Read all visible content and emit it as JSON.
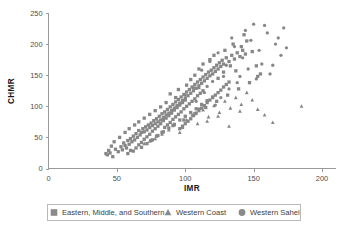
{
  "chart_data": {
    "type": "scatter",
    "title": "",
    "xlabel": "IMR",
    "ylabel": "CHMR",
    "xlim": [
      0,
      200
    ],
    "ylim": [
      0,
      250
    ],
    "xticks": [
      0,
      50,
      100,
      150,
      200
    ],
    "yticks": [
      0,
      50,
      100,
      150,
      200,
      250
    ],
    "grid": false,
    "legend_position": "bottom-center",
    "marker_color": "#878787",
    "axis_color": "#9a9a9a",
    "series": [
      {
        "name": "Eastern, Middle, and Southern",
        "marker": "square",
        "points": [
          [
            43,
            22
          ],
          [
            45,
            25
          ],
          [
            47,
            19
          ],
          [
            49,
            31
          ],
          [
            51,
            27
          ],
          [
            53,
            35
          ],
          [
            54,
            30
          ],
          [
            55,
            41
          ],
          [
            56,
            37
          ],
          [
            57,
            33
          ],
          [
            58,
            45
          ],
          [
            59,
            39
          ],
          [
            60,
            48
          ],
          [
            61,
            43
          ],
          [
            62,
            52
          ],
          [
            63,
            46
          ],
          [
            64,
            56
          ],
          [
            65,
            50
          ],
          [
            66,
            61
          ],
          [
            67,
            54
          ],
          [
            68,
            58
          ],
          [
            69,
            64
          ],
          [
            70,
            59
          ],
          [
            71,
            67
          ],
          [
            72,
            62
          ],
          [
            73,
            70
          ],
          [
            74,
            66
          ],
          [
            75,
            73
          ],
          [
            76,
            69
          ],
          [
            77,
            77
          ],
          [
            78,
            72
          ],
          [
            79,
            80
          ],
          [
            80,
            75
          ],
          [
            81,
            84
          ],
          [
            82,
            78
          ],
          [
            83,
            88
          ],
          [
            84,
            82
          ],
          [
            85,
            91
          ],
          [
            86,
            86
          ],
          [
            87,
            95
          ],
          [
            88,
            89
          ],
          [
            89,
            99
          ],
          [
            90,
            93
          ],
          [
            91,
            103
          ],
          [
            92,
            97
          ],
          [
            93,
            107
          ],
          [
            94,
            101
          ],
          [
            95,
            111
          ],
          [
            96,
            105
          ],
          [
            97,
            115
          ],
          [
            98,
            109
          ],
          [
            99,
            119
          ],
          [
            100,
            113
          ],
          [
            101,
            123
          ],
          [
            102,
            117
          ],
          [
            103,
            127
          ],
          [
            104,
            121
          ],
          [
            105,
            131
          ],
          [
            106,
            125
          ],
          [
            107,
            135
          ],
          [
            108,
            129
          ],
          [
            109,
            139
          ],
          [
            110,
            133
          ],
          [
            111,
            143
          ],
          [
            112,
            137
          ],
          [
            113,
            147
          ],
          [
            114,
            141
          ],
          [
            115,
            151
          ],
          [
            116,
            145
          ],
          [
            117,
            155
          ],
          [
            118,
            149
          ],
          [
            119,
            158
          ],
          [
            120,
            152
          ],
          [
            121,
            162
          ],
          [
            122,
            156
          ],
          [
            123,
            166
          ],
          [
            124,
            160
          ],
          [
            125,
            170
          ],
          [
            126,
            164
          ],
          [
            127,
            174
          ],
          [
            128,
            168
          ],
          [
            130,
            178
          ],
          [
            132,
            172
          ],
          [
            134,
            182
          ],
          [
            136,
            176
          ],
          [
            138,
            186
          ],
          [
            140,
            180
          ],
          [
            142,
            190
          ],
          [
            144,
            184
          ],
          [
            62,
            28
          ],
          [
            64,
            33
          ],
          [
            66,
            38
          ],
          [
            68,
            42
          ],
          [
            70,
            47
          ],
          [
            72,
            51
          ],
          [
            74,
            55
          ],
          [
            76,
            60
          ],
          [
            78,
            64
          ],
          [
            80,
            68
          ],
          [
            82,
            72
          ],
          [
            84,
            77
          ],
          [
            86,
            81
          ],
          [
            88,
            85
          ],
          [
            90,
            89
          ],
          [
            92,
            94
          ],
          [
            94,
            98
          ],
          [
            96,
            102
          ],
          [
            98,
            106
          ],
          [
            100,
            110
          ],
          [
            85,
            66
          ],
          [
            87,
            70
          ],
          [
            89,
            74
          ],
          [
            91,
            79
          ],
          [
            93,
            83
          ],
          [
            95,
            87
          ],
          [
            97,
            91
          ],
          [
            99,
            96
          ],
          [
            101,
            100
          ],
          [
            103,
            104
          ],
          [
            105,
            108
          ],
          [
            107,
            112
          ],
          [
            109,
            117
          ],
          [
            111,
            121
          ],
          [
            113,
            125
          ],
          [
            96,
            64
          ],
          [
            98,
            68
          ],
          [
            100,
            72
          ],
          [
            102,
            76
          ],
          [
            104,
            80
          ],
          [
            106,
            85
          ],
          [
            108,
            89
          ],
          [
            110,
            93
          ],
          [
            112,
            97
          ],
          [
            114,
            101
          ],
          [
            116,
            106
          ],
          [
            118,
            110
          ],
          [
            120,
            114
          ],
          [
            122,
            118
          ],
          [
            124,
            122
          ],
          [
            126,
            126
          ],
          [
            128,
            131
          ],
          [
            130,
            135
          ],
          [
            132,
            139
          ],
          [
            58,
            24
          ],
          [
            60,
            29
          ],
          [
            75,
            45
          ],
          [
            79,
            52
          ],
          [
            83,
            58
          ],
          [
            91,
            69
          ],
          [
            99,
            78
          ],
          [
            107,
            88
          ],
          [
            115,
            98
          ],
          [
            123,
            108
          ],
          [
            131,
            118
          ],
          [
            139,
            128
          ],
          [
            147,
            138
          ],
          [
            153,
            148
          ],
          [
            68,
            34
          ],
          [
            72,
            40
          ],
          [
            76,
            46
          ],
          [
            80,
            53
          ],
          [
            84,
            59
          ],
          [
            88,
            65
          ],
          [
            92,
            71
          ],
          [
            96,
            78
          ],
          [
            100,
            84
          ],
          [
            104,
            90
          ],
          [
            108,
            96
          ],
          [
            112,
            103
          ],
          [
            116,
            109
          ],
          [
            120,
            115
          ],
          [
            124,
            145
          ],
          [
            128,
            155
          ],
          [
            133,
            165
          ],
          [
            137,
            157
          ],
          [
            141,
            196
          ],
          [
            145,
            205
          ],
          [
            149,
            188
          ],
          [
            143,
            215
          ],
          [
            129,
            190
          ],
          [
            135,
            200
          ],
          [
            152,
            165
          ],
          [
            155,
            152
          ],
          [
            118,
            175
          ],
          [
            121,
            182
          ],
          [
            110,
            160
          ],
          [
            113,
            168
          ],
          [
            104,
            143
          ],
          [
            107,
            150
          ],
          [
            101,
            134
          ],
          [
            95,
            127
          ],
          [
            89,
            120
          ],
          [
            93,
            114
          ],
          [
            86,
            106
          ],
          [
            82,
            99
          ],
          [
            78,
            93
          ],
          [
            74,
            87
          ],
          [
            70,
            81
          ],
          [
            66,
            75
          ],
          [
            63,
            70
          ],
          [
            59,
            64
          ],
          [
            56,
            58
          ],
          [
            52,
            50
          ],
          [
            48,
            43
          ],
          [
            46,
            36
          ],
          [
            44,
            29
          ],
          [
            42,
            24
          ]
        ]
      },
      {
        "name": "Western Coast",
        "marker": "triangle",
        "points": [
          [
            78,
            48
          ],
          [
            83,
            55
          ],
          [
            88,
            62
          ],
          [
            92,
            70
          ],
          [
            96,
            58
          ],
          [
            101,
            78
          ],
          [
            105,
            86
          ],
          [
            109,
            72
          ],
          [
            113,
            94
          ],
          [
            117,
            83
          ],
          [
            121,
            101
          ],
          [
            125,
            90
          ],
          [
            129,
            108
          ],
          [
            133,
            97
          ],
          [
            137,
            114
          ],
          [
            141,
            103
          ],
          [
            145,
            122
          ],
          [
            149,
            110
          ],
          [
            116,
            76
          ],
          [
            124,
            84
          ],
          [
            132,
            68
          ],
          [
            140,
            92
          ],
          [
            164,
            74
          ],
          [
            185,
            100
          ],
          [
            153,
            95
          ],
          [
            158,
            86
          ],
          [
            70,
            40
          ],
          [
            74,
            44
          ],
          [
            98,
            66
          ],
          [
            110,
            130
          ]
        ]
      },
      {
        "name": "Western Sahel",
        "marker": "circle",
        "points": [
          [
            112,
            158
          ],
          [
            118,
            172
          ],
          [
            124,
            186
          ],
          [
            130,
            166
          ],
          [
            136,
            196
          ],
          [
            142,
            178
          ],
          [
            148,
            206
          ],
          [
            154,
            190
          ],
          [
            160,
            218
          ],
          [
            166,
            200
          ],
          [
            172,
            226
          ],
          [
            150,
            232
          ],
          [
            128,
            148
          ],
          [
            134,
            210
          ],
          [
            120,
            140
          ],
          [
            144,
            222
          ],
          [
            106,
            130
          ],
          [
            156,
            168
          ],
          [
            162,
            152
          ],
          [
            138,
            138
          ],
          [
            114,
            122
          ],
          [
            126,
            114
          ],
          [
            170,
            182
          ],
          [
            146,
            160
          ],
          [
            132,
            128
          ],
          [
            152,
            144
          ],
          [
            168,
            210
          ],
          [
            174,
            194
          ],
          [
            108,
            108
          ],
          [
            122,
            102
          ],
          [
            100,
            118
          ],
          [
            158,
            230
          ],
          [
            140,
            148
          ],
          [
            164,
            166
          ],
          [
            116,
            132
          ],
          [
            110,
            96
          ]
        ]
      }
    ]
  },
  "legend": {
    "items": [
      {
        "label": "Eastern, Middle, and Southern",
        "marker": "square"
      },
      {
        "label": "Western Coast",
        "marker": "triangle"
      },
      {
        "label": "Western Sahel",
        "marker": "circle"
      }
    ]
  },
  "axes": {
    "x_title": "IMR",
    "y_title": "CHMR",
    "x_tick_labels": [
      "0",
      "50",
      "100",
      "150",
      "200"
    ],
    "y_tick_labels": [
      "0",
      "50",
      "100",
      "150",
      "200",
      "250"
    ]
  }
}
